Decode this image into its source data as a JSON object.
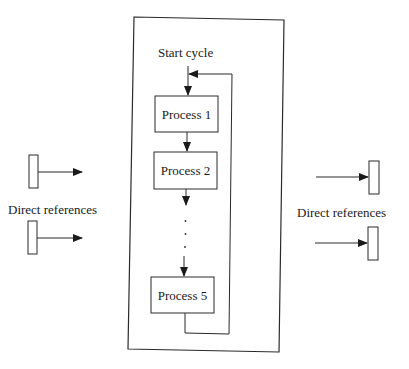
{
  "diagram": {
    "container": {
      "label": "cycle-container"
    },
    "start_label": "Start cycle",
    "processes": [
      {
        "id": "p1",
        "label": "Process 1"
      },
      {
        "id": "p2",
        "label": "Process 2"
      },
      {
        "id": "p5",
        "label": "Process 5"
      }
    ],
    "ellipsis": "...",
    "left_group": {
      "label": "Direct references",
      "count": 2,
      "arrow_direction": "outgoing"
    },
    "right_group": {
      "label": "Direct references",
      "count": 2,
      "arrow_direction": "incoming"
    },
    "colors": {
      "stroke": "#2a2a2a",
      "background": "#ffffff"
    }
  }
}
